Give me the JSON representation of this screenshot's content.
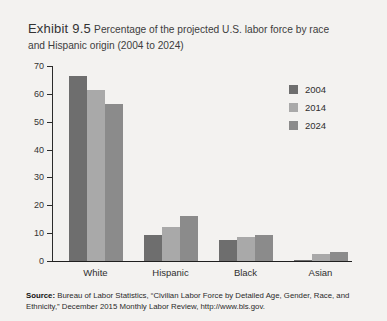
{
  "exhibit": {
    "label": "Exhibit 9.5",
    "title": "Percentage of the projected U.S. labor force by race and Hispanic origin (2004 to 2024)"
  },
  "source": {
    "prefix": "Source:",
    "text": " Bureau of Labor Statistics, “Civilian Labor Force by Detailed Age, Gender, Race, and Ethnicity,” December 2015 Monthly Labor Review, http://www.bls.gov."
  },
  "legend": {
    "items": [
      {
        "label": "2004",
        "color": "#6e6e6e"
      },
      {
        "label": "2014",
        "color": "#a9a9a9"
      },
      {
        "label": "2024",
        "color": "#8b8b8b"
      }
    ]
  },
  "axis": {
    "y_ticks": [
      "0",
      "10",
      "20",
      "30",
      "40",
      "50",
      "60",
      "70"
    ]
  },
  "chart_data": {
    "type": "bar",
    "title": "Percentage of the projected U.S. labor force by race and Hispanic origin (2004 to 2024)",
    "xlabel": "",
    "ylabel": "",
    "ylim": [
      0,
      70
    ],
    "ytick_step": 10,
    "grid": false,
    "legend_position": "top-right",
    "categories": [
      "White",
      "Hispanic",
      "Black",
      "Asian"
    ],
    "series": [
      {
        "name": "2004",
        "color": "#6e6e6e",
        "values": [
          66.5,
          9.5,
          7.5,
          0.5
        ]
      },
      {
        "name": "2014",
        "color": "#a9a9a9",
        "values": [
          61.5,
          12.3,
          8.5,
          2.5
        ]
      },
      {
        "name": "2024",
        "color": "#8b8b8b",
        "values": [
          56.5,
          16.1,
          9.2,
          3.2
        ]
      }
    ]
  }
}
